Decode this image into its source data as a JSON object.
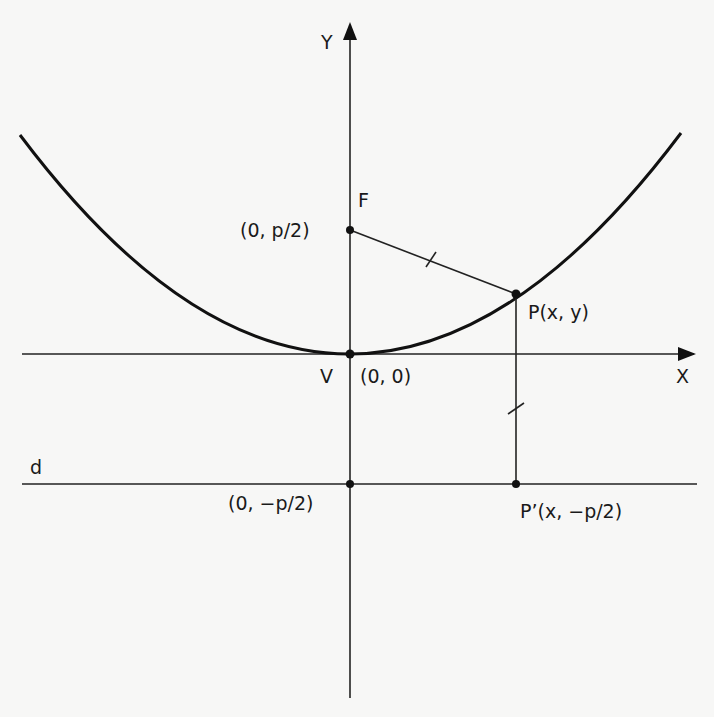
{
  "diagram": {
    "axes": {
      "x_label": "X",
      "y_label": "Y"
    },
    "points": {
      "focus": {
        "name": "F",
        "coords": "(0, p/2)"
      },
      "vertex": {
        "name": "V",
        "coords": "(0, 0)"
      },
      "point": {
        "label": "P(x, y)"
      },
      "projection": {
        "label": "P’(x, −p/2)"
      },
      "directrix_point": {
        "coords": "(0, −p/2)"
      }
    },
    "directrix": {
      "name": "d"
    },
    "colors": {
      "stroke": "#111111",
      "background": "#f7f7f6"
    }
  }
}
